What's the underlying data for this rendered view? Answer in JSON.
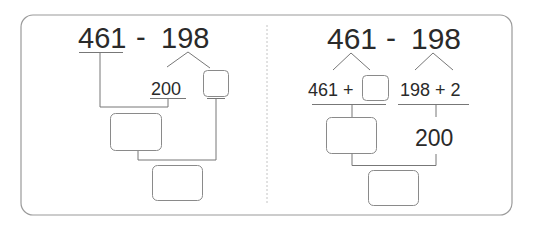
{
  "left_panel": {
    "expression": {
      "a": "461",
      "op": "-",
      "b": "198"
    },
    "decomposed_value": "200",
    "boxes": [
      "small-answer-box",
      "middle-answer-box",
      "result-box"
    ]
  },
  "right_panel": {
    "expression": {
      "a": "461",
      "op": "-",
      "b": "198"
    },
    "left_branch_label": "461 +",
    "right_branch_label": "198 + 2",
    "right_result": "200",
    "boxes": [
      "addend-box",
      "middle-answer-box",
      "result-box"
    ]
  },
  "colors": {
    "frame": "#8a8a8a",
    "line": "#777777",
    "text": "#2a2a2a",
    "divider": "#bdbdbd"
  }
}
